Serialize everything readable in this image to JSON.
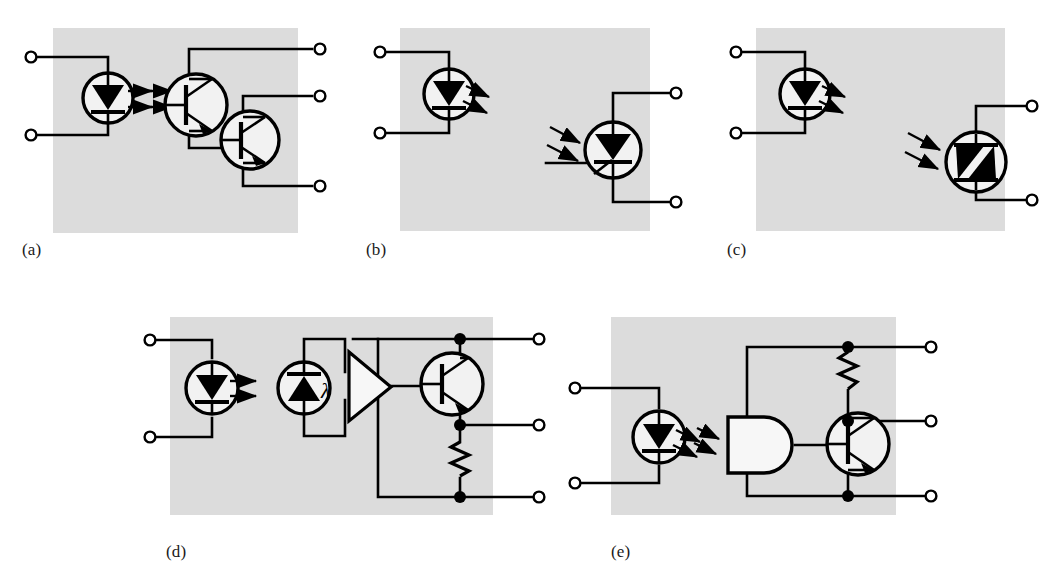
{
  "figure": {
    "type": "schematic-diagram",
    "background_color": "#ffffff",
    "panel_fill": "#dcdcdc",
    "line_color": "#000000",
    "terminal_fill": "#ffffff"
  },
  "panels": [
    {
      "id": "a",
      "caption": "(a)",
      "caption_x": 22,
      "caption_y": 250,
      "box": {
        "x": 53,
        "y": 28,
        "w": 245,
        "h": 205
      },
      "description": "LED coupled to Darlington phototransistor pair",
      "components": [
        "led",
        "photo-darlington-transistor",
        "transistor"
      ],
      "terminal_count": 5,
      "coupling_arrows": 2
    },
    {
      "id": "b",
      "caption": "(b)",
      "caption_x": 366,
      "caption_y": 250,
      "box": {
        "x": 400,
        "y": 28,
        "w": 250,
        "h": 203
      },
      "description": "LED coupled to photo-SCR (light activated thyristor) with gate lead",
      "components": [
        "led",
        "photo-scr"
      ],
      "terminal_count": 4,
      "coupling_arrows": 2
    },
    {
      "id": "c",
      "caption": "(c)",
      "caption_x": 727,
      "caption_y": 250,
      "box": {
        "x": 756,
        "y": 28,
        "w": 249,
        "h": 203
      },
      "description": "LED coupled to photo-TRIAC (bilateral light activated switch)",
      "components": [
        "led",
        "photo-triac"
      ],
      "terminal_count": 4,
      "coupling_arrows": 2
    },
    {
      "id": "d",
      "caption": "(d)",
      "caption_x": 166,
      "caption_y": 552,
      "box": {
        "x": 170,
        "y": 317,
        "w": 323,
        "h": 198
      },
      "description": "LED coupled to photodiode with amplifier, output transistor and resistor",
      "components": [
        "led",
        "photodiode-lambda",
        "amplifier",
        "transistor",
        "resistor"
      ],
      "terminal_count": 5,
      "coupling_arrows": 2,
      "label_lambda": "λ"
    },
    {
      "id": "e",
      "caption": "(e)",
      "caption_x": 611,
      "caption_y": 552,
      "box": {
        "x": 611,
        "y": 317,
        "w": 285,
        "h": 198
      },
      "description": "LED coupled to logic gate buffer with output transistor and pull-up resistor",
      "components": [
        "led",
        "logic-gate-buffer",
        "transistor",
        "resistor"
      ],
      "terminal_count": 5,
      "coupling_arrows": 2
    }
  ]
}
